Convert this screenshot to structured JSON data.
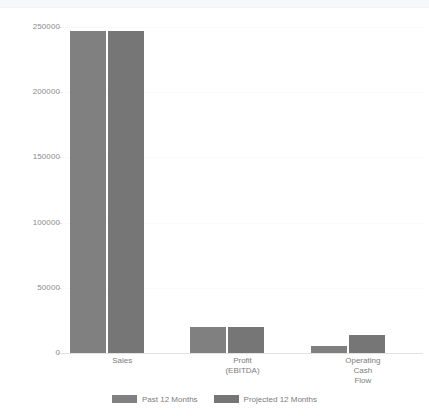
{
  "chart_data": {
    "type": "bar",
    "title": "",
    "subtitle": "",
    "xlabel": "",
    "ylabel": "",
    "categories": [
      "Sales",
      "Profit (EBITDA)",
      "Operating Cash Flow"
    ],
    "category_lines": [
      [
        "Sales"
      ],
      [
        "Profit",
        "(EBITDA)"
      ],
      [
        "Operating",
        "Cash",
        "Flow"
      ]
    ],
    "series": [
      {
        "name": "Past 12 Months",
        "color": "#808080",
        "values": [
          247000,
          20000,
          5000
        ]
      },
      {
        "name": "Projected 12 Months",
        "color": "#767676",
        "values": [
          247000,
          20000,
          14000
        ]
      }
    ],
    "ylim": [
      0,
      250000
    ],
    "yticks": [
      0,
      50000,
      100000,
      150000,
      200000,
      250000
    ],
    "ytick_labels": [
      "0",
      "50000",
      "100000",
      "150000",
      "200000",
      "250000"
    ],
    "grid": true,
    "legend_position": "bottom"
  },
  "legend": {
    "items": [
      {
        "label": "Past 12 Months",
        "color": "#808080"
      },
      {
        "label": "Projected 12 Months",
        "color": "#767676"
      }
    ]
  },
  "colors": {
    "background": "#ffffff",
    "past_series": "#808080",
    "projected_series": "#767676",
    "axis_line": "#e2e2e2",
    "tick_text": "#8a8a8a",
    "label_text": "#7d7d7d"
  }
}
